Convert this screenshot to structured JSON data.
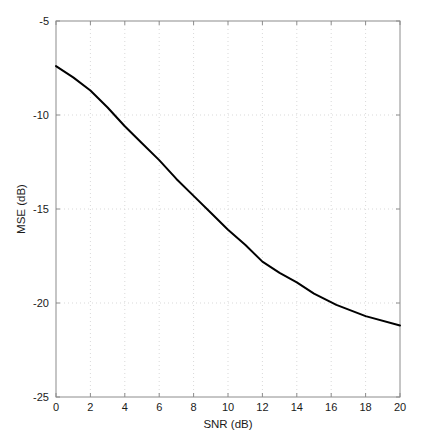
{
  "chart_data": {
    "type": "line",
    "title": "",
    "xlabel": "SNR (dB)",
    "ylabel": "MSE (dB)",
    "xlim": [
      0,
      20
    ],
    "ylim": [
      -25,
      -5
    ],
    "xticks": [
      0,
      2,
      4,
      6,
      8,
      10,
      12,
      14,
      16,
      18,
      20
    ],
    "xtick_labels": [
      "0",
      "2",
      "4",
      "6",
      "8",
      "10",
      "12",
      "14",
      "16",
      "18",
      "20"
    ],
    "yticks": [
      -25,
      -20,
      -15,
      -10,
      -5
    ],
    "ytick_labels": [
      "-25",
      "-20",
      "-15",
      "-10",
      "-5"
    ],
    "grid": true,
    "grid_style": "dotted",
    "grid_color": "#d9d9d9",
    "legend": null,
    "line_color": "#000000",
    "line_width": 2,
    "axis_color": "#808080",
    "series": [
      {
        "name": "MSE vs SNR",
        "x": [
          0,
          1,
          2,
          3,
          4,
          5,
          6,
          7,
          8,
          9,
          10,
          11,
          12,
          13,
          14,
          15,
          16.3,
          18,
          20
        ],
        "values": [
          -7.4,
          -8.0,
          -8.7,
          -9.6,
          -10.6,
          -11.5,
          -12.4,
          -13.4,
          -14.3,
          -15.2,
          -16.1,
          -16.9,
          -17.8,
          -18.4,
          -18.9,
          -19.5,
          -20.1,
          -20.7,
          -21.2
        ]
      }
    ]
  }
}
